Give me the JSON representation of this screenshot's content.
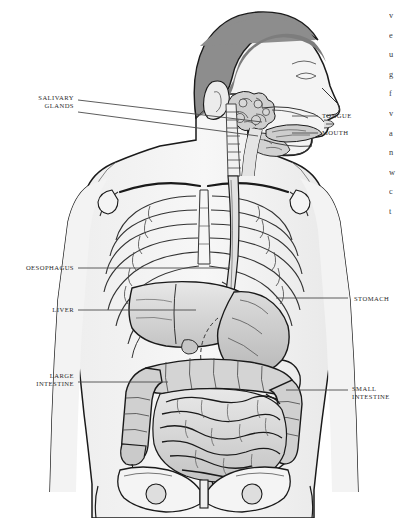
{
  "figure": {
    "view": "anterior torso with head in right-facing profile",
    "style": "grayscale line art",
    "colors": {
      "background": "#ffffff",
      "outline": "#1a1a1a",
      "hair": "#8a8a8a",
      "skin": "#f2f2f2",
      "bone": "#fbfbfb",
      "organ_light": "#e3e3e3",
      "organ_mid": "#cfcfcf",
      "organ_dark": "#b8b8b8",
      "leader_line": "#4a4a4a",
      "label_text": "#2b2b2b"
    }
  },
  "labels": [
    {
      "id": "salivary-glands",
      "lines": [
        "SALIVARY",
        "GLANDS"
      ],
      "side": "left",
      "x": 18,
      "y": 94,
      "width": 56
    },
    {
      "id": "oesophagus",
      "lines": [
        "OESOPHAGUS"
      ],
      "side": "left",
      "x": 2,
      "y": 264,
      "width": 72
    },
    {
      "id": "liver",
      "lines": [
        "LIVER"
      ],
      "side": "left",
      "x": 30,
      "y": 306,
      "width": 44
    },
    {
      "id": "large-intestine",
      "lines": [
        "LARGE",
        "INTESTINE"
      ],
      "side": "left",
      "x": 16,
      "y": 372,
      "width": 58
    },
    {
      "id": "tongue",
      "lines": [
        "TONGUE"
      ],
      "side": "right",
      "x": 322,
      "y": 112,
      "width": 60
    },
    {
      "id": "mouth",
      "lines": [
        "MOUTH"
      ],
      "side": "right",
      "x": 322,
      "y": 129,
      "width": 60
    },
    {
      "id": "stomach",
      "lines": [
        "STOMACH"
      ],
      "side": "right",
      "x": 354,
      "y": 295,
      "width": 60
    },
    {
      "id": "small-intestine",
      "lines": [
        "SMALL",
        "INTESTINE"
      ],
      "side": "right",
      "x": 352,
      "y": 385,
      "width": 60
    }
  ],
  "margin_text": {
    "note": "body-text column cropped at right image edge; only first glyphs visible",
    "lines": [
      "v",
      "e",
      "u",
      "g",
      "f",
      "v",
      "a",
      "n",
      "w",
      "c",
      "t"
    ]
  }
}
